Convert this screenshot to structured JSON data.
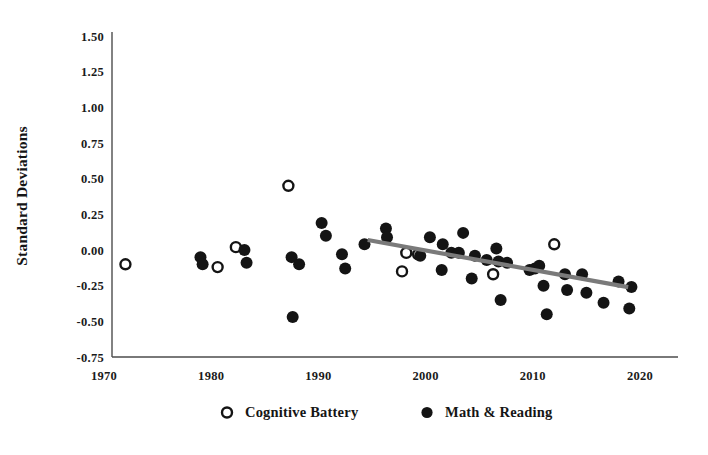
{
  "chart_data": {
    "type": "scatter",
    "title": "",
    "xlabel": "",
    "ylabel": "Standard Deviations",
    "xlim": [
      1968,
      2022
    ],
    "ylim": [
      -0.75,
      1.5
    ],
    "xticks": [
      1970,
      1980,
      1990,
      2000,
      2010,
      2020
    ],
    "xtick_labels": [
      "1970",
      "1980",
      "1990",
      "2000",
      "2010",
      "2020"
    ],
    "yticks": [
      -0.75,
      -0.5,
      -0.25,
      0.0,
      0.25,
      0.5,
      0.75,
      1.0,
      1.25,
      1.5
    ],
    "ytick_labels": [
      "-0.75",
      "-0.50",
      "-0.25",
      "0.00",
      "0.25",
      "0.50",
      "0.75",
      "1.00",
      "1.25",
      "1.50"
    ],
    "grid": false,
    "legend_position": "bottom",
    "colors": {
      "marker_filled": "#141414",
      "marker_hollow_stroke": "#141414",
      "marker_hollow_fill": "#ffffff",
      "trend_line": "#7a7a7a",
      "axis": "#4d4d4d",
      "text": "#151515",
      "background": "#ffffff"
    },
    "series": [
      {
        "name": "Cognitive Battery",
        "marker": "open-circle",
        "points": [
          {
            "x": 1972.0,
            "y": -0.1
          },
          {
            "x": 1980.6,
            "y": -0.12
          },
          {
            "x": 1982.3,
            "y": 0.02
          },
          {
            "x": 1987.2,
            "y": 0.45
          },
          {
            "x": 1998.2,
            "y": -0.02
          },
          {
            "x": 1999.3,
            "y": -0.03
          },
          {
            "x": 1997.8,
            "y": -0.15
          },
          {
            "x": 2006.3,
            "y": -0.17
          },
          {
            "x": 2012.0,
            "y": 0.04
          }
        ]
      },
      {
        "name": "Math & Reading",
        "marker": "filled-circle",
        "points": [
          {
            "x": 1979.0,
            "y": -0.05
          },
          {
            "x": 1979.2,
            "y": -0.1
          },
          {
            "x": 1983.1,
            "y": 0.0
          },
          {
            "x": 1983.3,
            "y": -0.09
          },
          {
            "x": 1987.5,
            "y": -0.05
          },
          {
            "x": 1988.2,
            "y": -0.1
          },
          {
            "x": 1987.6,
            "y": -0.47
          },
          {
            "x": 1990.3,
            "y": 0.19
          },
          {
            "x": 1990.7,
            "y": 0.1
          },
          {
            "x": 1992.2,
            "y": -0.03
          },
          {
            "x": 1992.5,
            "y": -0.13
          },
          {
            "x": 1994.3,
            "y": 0.04
          },
          {
            "x": 1996.3,
            "y": 0.15
          },
          {
            "x": 1996.4,
            "y": 0.09
          },
          {
            "x": 1999.5,
            "y": -0.04
          },
          {
            "x": 2000.4,
            "y": 0.09
          },
          {
            "x": 2001.6,
            "y": 0.04
          },
          {
            "x": 2002.4,
            "y": -0.02
          },
          {
            "x": 2003.1,
            "y": -0.02
          },
          {
            "x": 2003.5,
            "y": 0.12
          },
          {
            "x": 2001.5,
            "y": -0.14
          },
          {
            "x": 2004.6,
            "y": -0.04
          },
          {
            "x": 2004.3,
            "y": -0.2
          },
          {
            "x": 2005.7,
            "y": -0.07
          },
          {
            "x": 2006.6,
            "y": 0.01
          },
          {
            "x": 2006.8,
            "y": -0.08
          },
          {
            "x": 2007.6,
            "y": -0.09
          },
          {
            "x": 2007.0,
            "y": -0.35
          },
          {
            "x": 2009.7,
            "y": -0.14
          },
          {
            "x": 2010.2,
            "y": -0.13
          },
          {
            "x": 2010.6,
            "y": -0.11
          },
          {
            "x": 2011.0,
            "y": -0.25
          },
          {
            "x": 2011.3,
            "y": -0.45
          },
          {
            "x": 2013.0,
            "y": -0.17
          },
          {
            "x": 2013.2,
            "y": -0.28
          },
          {
            "x": 2014.6,
            "y": -0.17
          },
          {
            "x": 2015.0,
            "y": -0.3
          },
          {
            "x": 2016.6,
            "y": -0.37
          },
          {
            "x": 2018.0,
            "y": -0.22
          },
          {
            "x": 2019.0,
            "y": -0.41
          },
          {
            "x": 2019.2,
            "y": -0.26
          }
        ]
      }
    ],
    "trend": {
      "name": "Linear trend (Math & Reading)",
      "x_start": 1994.6,
      "y_start": 0.07,
      "x_end": 2018.9,
      "y_end": -0.26
    }
  },
  "legend": {
    "items": [
      {
        "label": "Cognitive Battery",
        "marker": "open-circle"
      },
      {
        "label": "Math & Reading",
        "marker": "filled-circle"
      }
    ]
  }
}
